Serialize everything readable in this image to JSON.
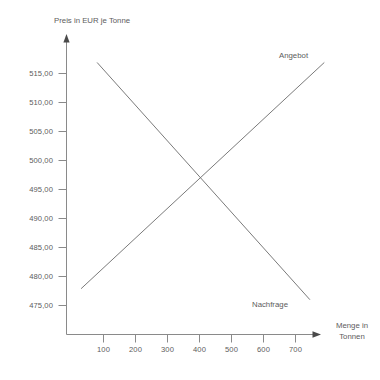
{
  "chart_data": {
    "type": "line",
    "title": "",
    "xlabel": "Menge in Tonnen",
    "ylabel": "Preis in EUR je Tonne",
    "xlim": [
      0,
      800
    ],
    "ylim": [
      470,
      520
    ],
    "grid": false,
    "legend": "inline-endpoint-labels",
    "x_ticks": [
      100,
      200,
      300,
      400,
      500,
      600,
      700
    ],
    "x_tick_labels": [
      "100",
      "200",
      "300",
      "400",
      "500",
      "600",
      "700"
    ],
    "y_ticks": [
      475,
      480,
      485,
      490,
      495,
      500,
      505,
      510,
      515
    ],
    "y_tick_labels": [
      "475,00",
      "480,00",
      "485,00",
      "490,00",
      "495,00",
      "500,00",
      "505,00",
      "510,00",
      "515,00"
    ],
    "series": [
      {
        "name": "Angebot",
        "type": "line",
        "x": [
          30,
          790
        ],
        "y": [
          477.9,
          516.9
        ],
        "color": "#6b6b6b"
      },
      {
        "name": "Nachfrage",
        "type": "line",
        "x": [
          80,
          745
        ],
        "y": [
          516.9,
          476.0
        ],
        "color": "#6b6b6b"
      }
    ],
    "equilibrium": {
      "x": 375,
      "y": 495.8
    },
    "annotations": [
      {
        "text": "Angebot",
        "x": 660,
        "y": 519.5
      },
      {
        "text": "Nachfrage",
        "x": 630,
        "y": 473.0
      }
    ]
  },
  "axes": {
    "y_axis_title": "Preis in EUR je Tonne",
    "x_axis_title_line1": "Menge in",
    "x_axis_title_line2": "Tonnen",
    "axis_color": "#8a8a8a",
    "tick_color": "#8a8a8a",
    "text_color": "#5c5c5c"
  },
  "labels": {
    "supply": "Angebot",
    "demand": "Nachfrage"
  }
}
